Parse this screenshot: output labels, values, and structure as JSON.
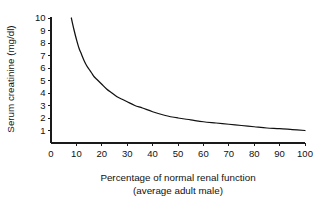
{
  "chart_data": {
    "type": "line",
    "title": "",
    "xlabel": "Percentage of normal renal function",
    "xlabel_line2": "(average adult male)",
    "ylabel": "Serum creatinine (mg/dl)",
    "xlim": [
      0,
      100
    ],
    "ylim": [
      0,
      10
    ],
    "grid": false,
    "legend": "none",
    "xticks": [
      0,
      10,
      20,
      30,
      40,
      50,
      60,
      70,
      80,
      90,
      100
    ],
    "xtick_labels": [
      "0",
      "10",
      "20",
      "30",
      "40",
      "50",
      "60",
      "70",
      "80",
      "90",
      "100"
    ],
    "yticks": [
      1,
      2,
      3,
      4,
      5,
      6,
      7,
      8,
      9,
      10
    ],
    "ytick_labels": [
      "1",
      "2",
      "3",
      "4",
      "5",
      "6",
      "7",
      "8",
      "9",
      "10"
    ],
    "series": [
      {
        "name": "serum creatinine",
        "color": "#111111",
        "x": [
          8,
          9,
          10,
          11,
          12,
          13,
          14,
          15,
          16,
          17,
          18,
          19,
          20,
          22,
          24,
          26,
          28,
          30,
          33,
          36,
          40,
          45,
          50,
          55,
          60,
          65,
          70,
          75,
          80,
          85,
          90,
          95,
          100
        ],
        "y": [
          10.0,
          9.1,
          8.3,
          7.6,
          7.1,
          6.6,
          6.2,
          5.9,
          5.6,
          5.3,
          5.1,
          4.9,
          4.7,
          4.3,
          4.0,
          3.7,
          3.5,
          3.3,
          3.0,
          2.8,
          2.5,
          2.2,
          2.0,
          1.85,
          1.7,
          1.6,
          1.5,
          1.4,
          1.3,
          1.2,
          1.15,
          1.07,
          1.0
        ]
      }
    ]
  },
  "figure": {
    "background_color": "#ffffff",
    "line_color": "#111111"
  }
}
